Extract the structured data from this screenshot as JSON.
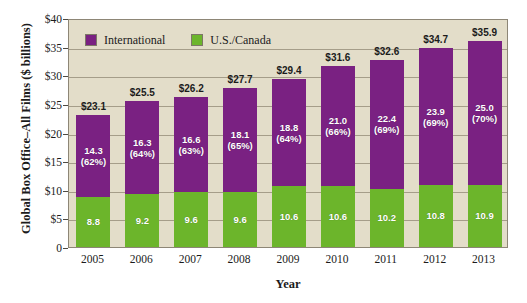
{
  "top_cut_text": "",
  "chart_data": {
    "type": "bar",
    "subtype": "stacked-vertical",
    "title": "",
    "xlabel": "Year",
    "ylabel": "Global Box Office–All Films ($ billions)",
    "ylim": [
      0,
      40
    ],
    "ytick_values": [
      0,
      5,
      10,
      15,
      20,
      25,
      30,
      35,
      40
    ],
    "ytick_labels": [
      "0",
      "$5",
      "$10",
      "$15",
      "$20",
      "$25",
      "$30",
      "$35",
      "$40"
    ],
    "grid": true,
    "grid_axis": "y",
    "legend_position": "top-left-inside",
    "categories": [
      "2005",
      "2006",
      "2007",
      "2008",
      "2009",
      "2010",
      "2011",
      "2012",
      "2013"
    ],
    "series": [
      {
        "name": "U.S./Canada",
        "color": "#6cb52b",
        "values": [
          8.8,
          9.2,
          9.6,
          9.6,
          10.6,
          10.6,
          10.2,
          10.8,
          10.9
        ],
        "labels": [
          "8.8",
          "9.2",
          "9.6",
          "9.6",
          "10.6",
          "10.6",
          "10.2",
          "10.8",
          "10.9"
        ]
      },
      {
        "name": "International",
        "color": "#7a2182",
        "values": [
          14.3,
          16.3,
          16.6,
          18.1,
          18.8,
          21.0,
          22.4,
          23.9,
          25.0
        ],
        "labels": [
          "14.3",
          "16.3",
          "16.6",
          "18.1",
          "18.8",
          "21.0",
          "22.4",
          "23.9",
          "25.0"
        ],
        "percent_labels": [
          "(62%)",
          "(64%)",
          "(63%)",
          "(65%)",
          "(64%)",
          "(66%)",
          "(69%)",
          "(69%)",
          "(70%)"
        ]
      }
    ],
    "totals": [
      23.1,
      25.5,
      26.2,
      27.7,
      29.4,
      31.6,
      32.6,
      34.7,
      35.9
    ],
    "total_labels": [
      "$23.1",
      "$25.5",
      "$26.2",
      "$27.7",
      "$29.4",
      "$31.6",
      "$32.6",
      "$34.7",
      "$35.9"
    ]
  },
  "colors": {
    "international": "#7a2182",
    "us_canada": "#6cb52b",
    "plot_background": "#e3ddc9",
    "grid": "#a59d89",
    "frame": "#8d8676",
    "page_background": "#ffffff",
    "text": "#1b1b1b"
  }
}
